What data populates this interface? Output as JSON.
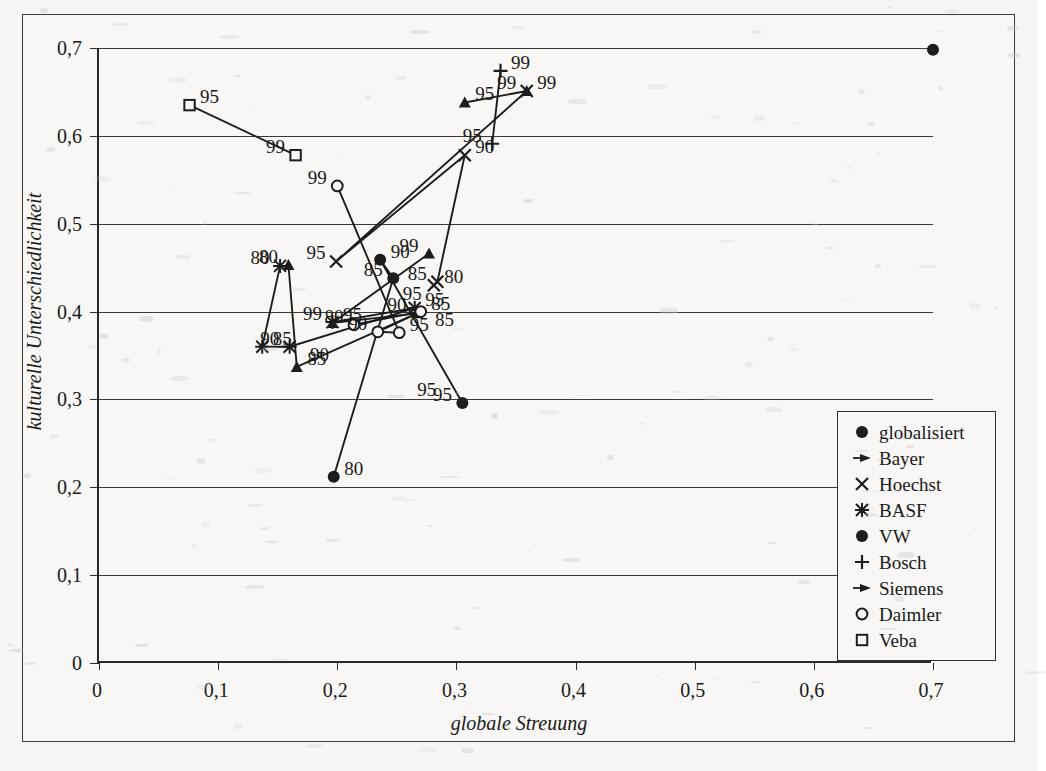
{
  "figure": {
    "background_color": "#f7f6f4",
    "ink_color": "#1d1d1d"
  },
  "axes": {
    "x_title": "globale Streuung",
    "y_title": "kulturelle Unterschiedlichkeit",
    "x_ticks": [
      "0",
      "0,1",
      "0,2",
      "0,3",
      "0,4",
      "0,5",
      "0,6",
      "0,7"
    ],
    "y_ticks": [
      "0",
      "0,1",
      "0,2",
      "0,3",
      "0,4",
      "0,5",
      "0,6",
      "0,7"
    ],
    "x_values": [
      0,
      0.1,
      0.2,
      0.3,
      0.4,
      0.5,
      0.6,
      0.7
    ],
    "y_values": [
      0,
      0.1,
      0.2,
      0.3,
      0.4,
      0.5,
      0.6,
      0.7
    ]
  },
  "legend": {
    "position": "bottom-right",
    "items": [
      {
        "label": "globalisiert",
        "marker": "filled-circle"
      },
      {
        "label": "Bayer",
        "marker": "arrow-triangle"
      },
      {
        "label": "Hoechst",
        "marker": "x-cross"
      },
      {
        "label": "BASF",
        "marker": "asterisk"
      },
      {
        "label": "VW",
        "marker": "filled-circle"
      },
      {
        "label": "Bosch",
        "marker": "plus"
      },
      {
        "label": "Siemens",
        "marker": "arrow-triangle"
      },
      {
        "label": "Daimler",
        "marker": "open-circle"
      },
      {
        "label": "Veba",
        "marker": "open-square"
      }
    ]
  },
  "chart_data": {
    "type": "scatter",
    "title": "",
    "xlabel": "globale Streuung",
    "ylabel": "kulturelle Unterschiedlichkeit",
    "xlim": [
      0,
      0.7
    ],
    "ylim": [
      0,
      0.7
    ],
    "grid": "horizontal",
    "point_labels_are": "years (80 = 1980, 85 = 1985, 90 = 1990, 95 = 1995, 99 = 1999)",
    "series": [
      {
        "name": "globalisiert",
        "marker": "filled-circle",
        "connected": false,
        "points": [
          {
            "label": "",
            "x": 0.7,
            "y": 0.698
          }
        ]
      },
      {
        "name": "Bayer",
        "marker": "arrow-triangle",
        "connected": true,
        "points": [
          {
            "label": "80",
            "x": 0.159,
            "y": 0.453
          },
          {
            "label": "85",
            "x": 0.166,
            "y": 0.337
          },
          {
            "label": "90",
            "x": 0.267,
            "y": 0.398
          },
          {
            "label": "95",
            "x": 0.196,
            "y": 0.387
          },
          {
            "label": "99",
            "x": 0.277,
            "y": 0.466
          }
        ]
      },
      {
        "name": "Hoechst",
        "marker": "x-cross",
        "connected": true,
        "points": [
          {
            "label": "80",
            "x": 0.281,
            "y": 0.43
          },
          {
            "label": "85",
            "x": 0.284,
            "y": 0.434
          },
          {
            "label": "90",
            "x": 0.307,
            "y": 0.578
          },
          {
            "label": "95",
            "x": 0.199,
            "y": 0.457
          },
          {
            "label": "99",
            "x": 0.359,
            "y": 0.651
          }
        ]
      },
      {
        "name": "BASF",
        "marker": "asterisk",
        "connected": true,
        "points": [
          {
            "label": "80",
            "x": 0.152,
            "y": 0.452
          },
          {
            "label": "85",
            "x": 0.137,
            "y": 0.36
          },
          {
            "label": "90",
            "x": 0.16,
            "y": 0.36
          },
          {
            "label": "95",
            "x": 0.265,
            "y": 0.404
          },
          {
            "label": "99",
            "x": 0.196,
            "y": 0.388
          }
        ]
      },
      {
        "name": "VW",
        "marker": "filled-circle",
        "connected": true,
        "points": [
          {
            "label": "80",
            "x": 0.197,
            "y": 0.212
          },
          {
            "label": "85",
            "x": 0.247,
            "y": 0.438
          },
          {
            "label": "90",
            "x": 0.236,
            "y": 0.459
          },
          {
            "label": "95",
            "x": 0.305,
            "y": 0.296
          }
        ]
      },
      {
        "name": "Bosch",
        "marker": "plus",
        "connected": true,
        "points": [
          {
            "label": "95",
            "x": 0.33,
            "y": 0.591
          },
          {
            "label": "99",
            "x": 0.337,
            "y": 0.674
          }
        ]
      },
      {
        "name": "Siemens",
        "marker": "arrow-triangle",
        "connected": true,
        "points": [
          {
            "label": "95",
            "x": 0.307,
            "y": 0.638
          },
          {
            "label": "99",
            "x": 0.359,
            "y": 0.651
          }
        ]
      },
      {
        "name": "Daimler",
        "marker": "open-circle",
        "connected": true,
        "points": [
          {
            "label": "80",
            "x": 0.214,
            "y": 0.385
          },
          {
            "label": "85",
            "x": 0.27,
            "y": 0.4
          },
          {
            "label": "90",
            "x": 0.234,
            "y": 0.377
          },
          {
            "label": "95",
            "x": 0.252,
            "y": 0.376
          },
          {
            "label": "99",
            "x": 0.2,
            "y": 0.543
          }
        ]
      },
      {
        "name": "Veba",
        "marker": "open-square",
        "connected": true,
        "points": [
          {
            "label": "95",
            "x": 0.076,
            "y": 0.635
          },
          {
            "label": "99",
            "x": 0.165,
            "y": 0.578
          }
        ]
      }
    ],
    "extra_year_labels": [
      {
        "text": "95",
        "x": 0.263,
        "y": 0.421
      },
      {
        "text": "95",
        "x": 0.275,
        "y": 0.312
      },
      {
        "text": "90",
        "x": 0.185,
        "y": 0.352
      },
      {
        "text": "85",
        "x": 0.29,
        "y": 0.392
      }
    ]
  }
}
